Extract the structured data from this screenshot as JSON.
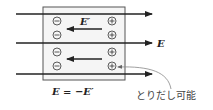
{
  "diagram": {
    "type": "conductor-in-field",
    "external_field_label": "E",
    "internal_field_label": "E′",
    "equation_label": "E = −E′",
    "annotation_label": "とりだし可能",
    "negative_charge_symbol": "−",
    "positive_charge_symbol": "+",
    "negative_charges_count": 4,
    "positive_charges_count": 4,
    "external_field_lines_count": 3,
    "internal_field_arrows_count": 2,
    "colors": {
      "line": "#222222",
      "box": "#555555",
      "box_fill": "#f4f4f4",
      "annotation_curve": "#888888",
      "text": "#222222"
    }
  }
}
